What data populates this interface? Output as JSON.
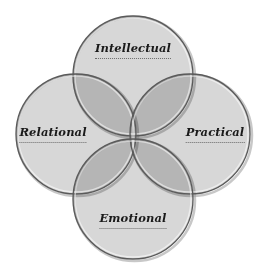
{
  "diagram": {
    "type": "venn",
    "circles": [
      {
        "id": "intellectual",
        "label": "Intellectual",
        "cx": 133,
        "cy": 76,
        "r": 60
      },
      {
        "id": "relational",
        "label": "Relational",
        "cx": 76,
        "cy": 134,
        "r": 60
      },
      {
        "id": "practical",
        "label": "Practical",
        "cx": 190,
        "cy": 134,
        "r": 60
      },
      {
        "id": "emotional",
        "label": "Emotional",
        "cx": 133,
        "cy": 199,
        "r": 60
      }
    ],
    "labels": {
      "intellectual": {
        "text": "Intellectual",
        "x": 133,
        "y": 41
      },
      "relational": {
        "text": "Relational",
        "x": 53,
        "y": 125
      },
      "practical": {
        "text": "Practical",
        "x": 215,
        "y": 125
      },
      "emotional": {
        "text": "Emotional",
        "x": 133,
        "y": 211
      }
    },
    "colors": {
      "fill": "#c8c8c8",
      "fill_opacity": 0.72,
      "stroke": "#5a5a5a",
      "highlight": "#ffffff",
      "shadow": "#9a9a9a",
      "label_text": "#1a1a1a",
      "underline": "#6a6a6a"
    }
  }
}
